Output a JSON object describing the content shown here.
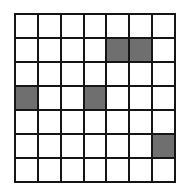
{
  "figure": {
    "type": "grid",
    "rows": 7,
    "cols": 7,
    "background_color": "#ffffff",
    "line_color": "#151515",
    "empty_cell_color": "#ffffff",
    "filled_cell_color": "#6f6f6f",
    "filled_cells": [
      {
        "row": 1,
        "col": 4
      },
      {
        "row": 1,
        "col": 5
      },
      {
        "row": 3,
        "col": 0
      },
      {
        "row": 3,
        "col": 3
      },
      {
        "row": 5,
        "col": 6
      }
    ],
    "cell_states": [
      [
        "empty",
        "empty",
        "empty",
        "empty",
        "empty",
        "empty",
        "empty"
      ],
      [
        "empty",
        "empty",
        "empty",
        "empty",
        "filled",
        "filled",
        "empty"
      ],
      [
        "empty",
        "empty",
        "empty",
        "empty",
        "empty",
        "empty",
        "empty"
      ],
      [
        "filled",
        "empty",
        "empty",
        "filled",
        "empty",
        "empty",
        "empty"
      ],
      [
        "empty",
        "empty",
        "empty",
        "empty",
        "empty",
        "empty",
        "empty"
      ],
      [
        "empty",
        "empty",
        "empty",
        "empty",
        "empty",
        "empty",
        "filled"
      ],
      [
        "empty",
        "empty",
        "empty",
        "empty",
        "empty",
        "empty",
        "empty"
      ]
    ]
  }
}
